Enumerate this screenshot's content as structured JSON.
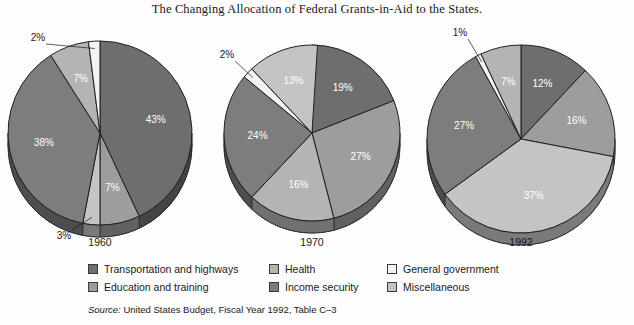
{
  "title": "The Changing Allocation of Federal Grants-in-Aid to the States.",
  "source": {
    "label": "Source:",
    "text": "United States Budget, Fiscal Year 1992, Table C–3"
  },
  "legend": {
    "items": [
      {
        "label": "Transportation and highways",
        "color": "#6e6e6e",
        "swatch_name": "legend-swatch-transportation"
      },
      {
        "label": "Health",
        "color": "#b4b4b4",
        "swatch_name": "legend-swatch-health"
      },
      {
        "label": "General government",
        "color": "#f2f2f2",
        "swatch_name": "legend-swatch-general-government"
      },
      {
        "label": "Education and training",
        "color": "#9d9d9d",
        "swatch_name": "legend-swatch-education"
      },
      {
        "label": "Income security",
        "color": "#7d7d7d",
        "swatch_name": "legend-swatch-income-security"
      },
      {
        "label": "Miscellaneous",
        "color": "#c4c4c4",
        "swatch_name": "legend-swatch-miscellaneous"
      }
    ]
  },
  "chart_data": {
    "type": "pie",
    "title": "The Changing Allocation of Federal Grants-in-Aid to the States.",
    "xlabel": "",
    "ylabel": "",
    "legend_position": "bottom",
    "grid": false,
    "categories": [
      "Transportation and highways",
      "Education and training",
      "Health",
      "Income security",
      "General government",
      "Miscellaneous"
    ],
    "colors": [
      "#6e6e6e",
      "#9d9d9d",
      "#b4b4b4",
      "#7d7d7d",
      "#f2f2f2",
      "#c4c4c4"
    ],
    "units": "percent",
    "pies": [
      {
        "year": "1960",
        "cx": 100,
        "cy": 133,
        "rx": 92,
        "ry": 92,
        "depth": 12,
        "slices": [
          {
            "category": "Transportation and highways",
            "value": 43,
            "label": "43%",
            "color": "#6e6e6e",
            "inside": true
          },
          {
            "category": "Education and training",
            "value": 7,
            "label": "7%",
            "color": "#9d9d9d",
            "inside": true
          },
          {
            "category": "Miscellaneous",
            "value": 3,
            "label": "3%",
            "color": "#c4c4c4",
            "inside": false,
            "lx": 64,
            "ly": 236,
            "ax": 80,
            "ay": 214
          },
          {
            "category": "Income security",
            "value": 38,
            "label": "38%",
            "color": "#7d7d7d",
            "inside": true
          },
          {
            "category": "Health",
            "value": 7,
            "label": "7%",
            "color": "#b4b4b4",
            "inside": true
          },
          {
            "category": "General government",
            "value": 2,
            "label": "2%",
            "color": "#f2f2f2",
            "inside": false,
            "lx": 38,
            "ly": 38,
            "ax": 58,
            "ay": 62
          }
        ]
      },
      {
        "year": "1970",
        "cx": 312,
        "cy": 133,
        "rx": 88,
        "ry": 88,
        "depth": 12,
        "slices": [
          {
            "category": "Transportation and highways",
            "value": 19,
            "label": "19%",
            "color": "#6e6e6e",
            "inside": true
          },
          {
            "category": "Education and training",
            "value": 27,
            "label": "27%",
            "color": "#9d9d9d",
            "inside": true
          },
          {
            "category": "Health",
            "value": 16,
            "label": "16%",
            "color": "#b4b4b4",
            "inside": true
          },
          {
            "category": "Income security",
            "value": 24,
            "label": "24%",
            "color": "#7d7d7d",
            "inside": true
          },
          {
            "category": "General government",
            "value": 2,
            "label": "2%",
            "color": "#f2f2f2",
            "inside": false,
            "lx": 227,
            "ly": 55,
            "ax": 250,
            "ay": 66
          },
          {
            "category": "Miscellaneous",
            "value": 13,
            "label": "13%",
            "color": "#c4c4c4",
            "inside": true
          }
        ]
      },
      {
        "year": "1992",
        "cx": 521,
        "cy": 139,
        "rx": 94,
        "ry": 94,
        "depth": 12,
        "slices": [
          {
            "category": "Transportation and highways",
            "value": 12,
            "label": "12%",
            "color": "#6e6e6e",
            "inside": true
          },
          {
            "category": "Education and training",
            "value": 16,
            "label": "16%",
            "color": "#9d9d9d",
            "inside": true
          },
          {
            "category": "Health",
            "value": 37,
            "label": "37%",
            "color": "#c4c4c4",
            "inside": true
          },
          {
            "category": "Income security",
            "value": 27,
            "label": "27%",
            "color": "#7d7d7d",
            "inside": true
          },
          {
            "category": "General government",
            "value": 1,
            "label": "1%",
            "color": "#f2f2f2",
            "inside": false,
            "lx": 460,
            "ly": 33,
            "ax": 473,
            "ay": 54
          },
          {
            "category": "Miscellaneous",
            "value": 7,
            "label": "7%",
            "color": "#b4b4b4",
            "inside": true
          }
        ]
      }
    ],
    "year_label_y": 243
  }
}
